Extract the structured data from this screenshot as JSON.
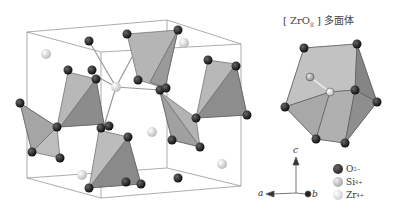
{
  "figure": {
    "polyhedron_title_prefix": "[ ZrO",
    "polyhedron_title_sub": "8",
    "polyhedron_title_suffix": " ] 多面体",
    "axes": {
      "a": "a",
      "b": "b",
      "c": "c"
    },
    "legend": [
      {
        "symbol": "O",
        "charge": "2−",
        "color": "#1a1a1a"
      },
      {
        "symbol": "Si",
        "charge": "4+",
        "color": "#b9b9b9"
      },
      {
        "symbol": "Zr",
        "charge": "4+",
        "color": "#dcdcdc"
      }
    ],
    "colors": {
      "cell_edge": "#777777",
      "tetra_light": "#b4b4b4",
      "tetra_dark": "#8a8a8a",
      "oxygen": "#1a1a1a",
      "zr": "#e4e4e4"
    }
  }
}
